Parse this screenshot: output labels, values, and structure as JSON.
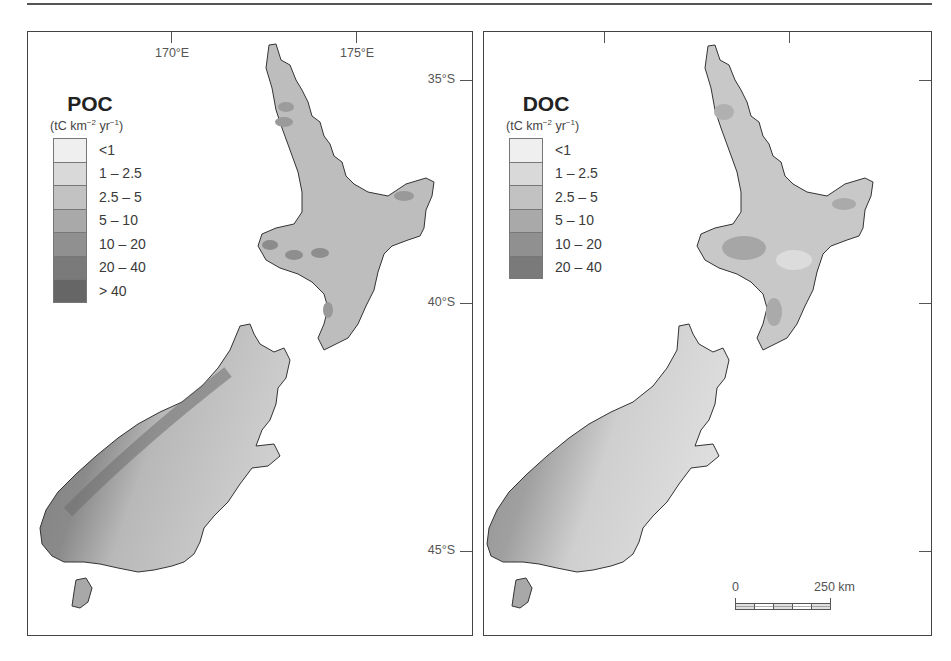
{
  "figure": {
    "panels": [
      {
        "id": "poc",
        "title": "POC",
        "units": {
          "base": "(tC km",
          "exp1": "−2",
          "mid": " yr",
          "exp2": "−1",
          "end": ")"
        },
        "legend": [
          {
            "label": "<1",
            "color": "#efefef"
          },
          {
            "label": "1 – 2.5",
            "color": "#d9d9d9"
          },
          {
            "label": "2.5 – 5",
            "color": "#c2c2c2"
          },
          {
            "label": "5 – 10",
            "color": "#a9a9a9"
          },
          {
            "label": "10 – 20",
            "color": "#909090"
          },
          {
            "label": "20 – 40",
            "color": "#7a7a7a"
          },
          {
            "label": "> 40",
            "color": "#666666"
          }
        ],
        "longitude_labels": [
          "170°E",
          "175°E"
        ],
        "latitude_labels": [
          "35°S",
          "40°S",
          "45°S"
        ]
      },
      {
        "id": "doc",
        "title": "DOC",
        "units": {
          "base": "(tC km",
          "exp1": "−2",
          "mid": " yr",
          "exp2": "−1",
          "end": ")"
        },
        "legend": [
          {
            "label": "<1",
            "color": "#efefef"
          },
          {
            "label": "1 – 2.5",
            "color": "#d9d9d9"
          },
          {
            "label": "2.5 – 5",
            "color": "#c2c2c2"
          },
          {
            "label": "5 – 10",
            "color": "#a9a9a9"
          },
          {
            "label": "10 – 20",
            "color": "#909090"
          },
          {
            "label": "20 – 40",
            "color": "#7a7a7a"
          }
        ],
        "scale_bar": {
          "start": "0",
          "end": "250 km"
        }
      }
    ]
  }
}
